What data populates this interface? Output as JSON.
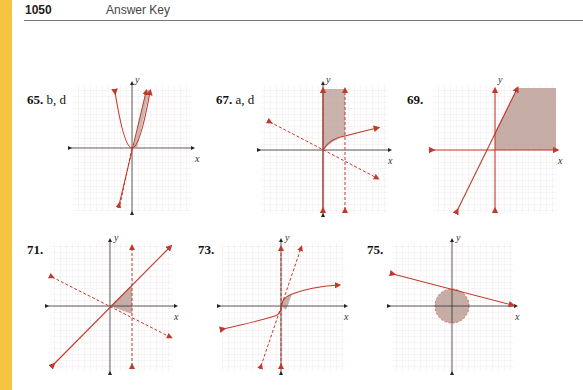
{
  "header": {
    "page_number": "1050",
    "title": "Answer Key"
  },
  "colors": {
    "strip": "#F4C542",
    "curve": "#C0392B",
    "shade": "#B89A90",
    "grid": "#E8D6D6",
    "axis": "#333333"
  },
  "graphs": [
    {
      "number": "65.",
      "answer": "b, d",
      "axis_x": "x",
      "axis_y": "y"
    },
    {
      "number": "67.",
      "answer": "a, d",
      "axis_x": "x",
      "axis_y": "y"
    },
    {
      "number": "69.",
      "answer": "",
      "axis_x": "x",
      "axis_y": "y"
    },
    {
      "number": "71.",
      "answer": "",
      "axis_x": "x",
      "axis_y": "y"
    },
    {
      "number": "73.",
      "answer": "",
      "axis_x": "x",
      "axis_y": "y"
    },
    {
      "number": "75.",
      "answer": "",
      "axis_x": "x",
      "axis_y": "y"
    }
  ]
}
